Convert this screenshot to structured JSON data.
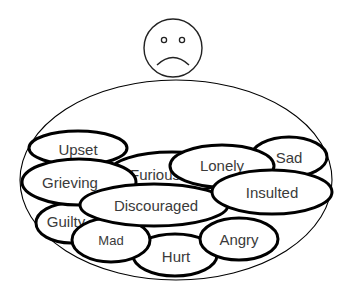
{
  "face": {
    "expression": "sad",
    "icon": "sad-face-icon",
    "cx": 173,
    "cy": 48,
    "r": 29
  },
  "container": {
    "cx": 176,
    "cy": 180,
    "rx": 156,
    "ry": 100,
    "stroke": "#000000"
  },
  "emotions": [
    {
      "label": "Furious",
      "cx": 172,
      "cy": 172,
      "rx": 62,
      "ry": 20,
      "text_x": 155,
      "text_y": 174,
      "font_size": 15
    },
    {
      "label": "Upset",
      "cx": 78,
      "cy": 148,
      "rx": 49,
      "ry": 17,
      "text_x": 78,
      "text_y": 149,
      "font_size": 15
    },
    {
      "label": "Sad",
      "cx": 289,
      "cy": 157,
      "rx": 38,
      "ry": 20,
      "text_x": 289,
      "text_y": 157,
      "font_size": 15
    },
    {
      "label": "Guilty",
      "cx": 71,
      "cy": 223,
      "rx": 35,
      "ry": 20,
      "text_x": 66,
      "text_y": 221,
      "font_size": 15
    },
    {
      "label": "Hurt",
      "cx": 175,
      "cy": 255,
      "rx": 42,
      "ry": 21,
      "text_x": 176,
      "text_y": 256,
      "font_size": 15
    },
    {
      "label": "Angry",
      "cx": 239,
      "cy": 239,
      "rx": 39,
      "ry": 21,
      "text_x": 239,
      "text_y": 239,
      "font_size": 15
    },
    {
      "label": "Mad",
      "cx": 111,
      "cy": 240,
      "rx": 39,
      "ry": 22,
      "text_x": 111,
      "text_y": 240,
      "font_size": 13
    },
    {
      "label": "Grieving",
      "cx": 79,
      "cy": 182,
      "rx": 57,
      "ry": 23,
      "text_x": 70,
      "text_y": 182,
      "font_size": 15
    },
    {
      "label": "Lonely",
      "cx": 222,
      "cy": 166,
      "rx": 52,
      "ry": 21,
      "text_x": 222,
      "text_y": 165,
      "font_size": 15
    },
    {
      "label": "Discouraged",
      "cx": 154,
      "cy": 205,
      "rx": 74,
      "ry": 21,
      "text_x": 156,
      "text_y": 205,
      "font_size": 15
    },
    {
      "label": "Insulted",
      "cx": 272,
      "cy": 192,
      "rx": 60,
      "ry": 22,
      "text_x": 272,
      "text_y": 192,
      "font_size": 15
    }
  ]
}
